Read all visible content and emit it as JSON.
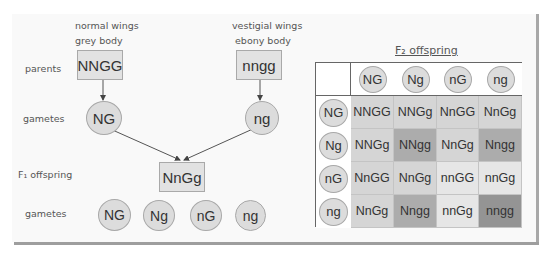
{
  "parents": {
    "row_label": "parents",
    "left": {
      "phenotype_line1": "normal wings",
      "phenotype_line2": "grey body",
      "genotype": "NNGG"
    },
    "right": {
      "phenotype_line1": "vestigial wings",
      "phenotype_line2": "ebony body",
      "genotype": "nngg"
    }
  },
  "gametes_parent": {
    "row_label": "gametes",
    "left": "NG",
    "right": "ng"
  },
  "f1": {
    "row_label": "F₁ offspring",
    "genotype": "NnGg"
  },
  "gametes_f1": {
    "row_label": "gametes",
    "items": [
      "NG",
      "Ng",
      "nG",
      "ng"
    ]
  },
  "punnett": {
    "title": "F₂ offspring",
    "col_headers": [
      "NG",
      "Ng",
      "nG",
      "ng"
    ],
    "row_headers": [
      "NG",
      "Ng",
      "nG",
      "ng"
    ],
    "cells": [
      [
        "NNGG",
        "NNGg",
        "NnGG",
        "NnGg"
      ],
      [
        "NNGg",
        "NNgg",
        "NnGg",
        "Nngg"
      ],
      [
        "NnGG",
        "NnGg",
        "nnGG",
        "nnGg"
      ],
      [
        "NnGg",
        "Nngg",
        "nnGg",
        "nngg"
      ]
    ],
    "shades": [
      [
        "#d5d5d5",
        "#d5d5d5",
        "#d5d5d5",
        "#d5d5d5"
      ],
      [
        "#d5d5d5",
        "#acacac",
        "#d5d5d5",
        "#acacac"
      ],
      [
        "#d5d5d5",
        "#d5d5d5",
        "#e6e6e6",
        "#e6e6e6"
      ],
      [
        "#d5d5d5",
        "#acacac",
        "#e6e6e6",
        "#949494"
      ]
    ]
  }
}
